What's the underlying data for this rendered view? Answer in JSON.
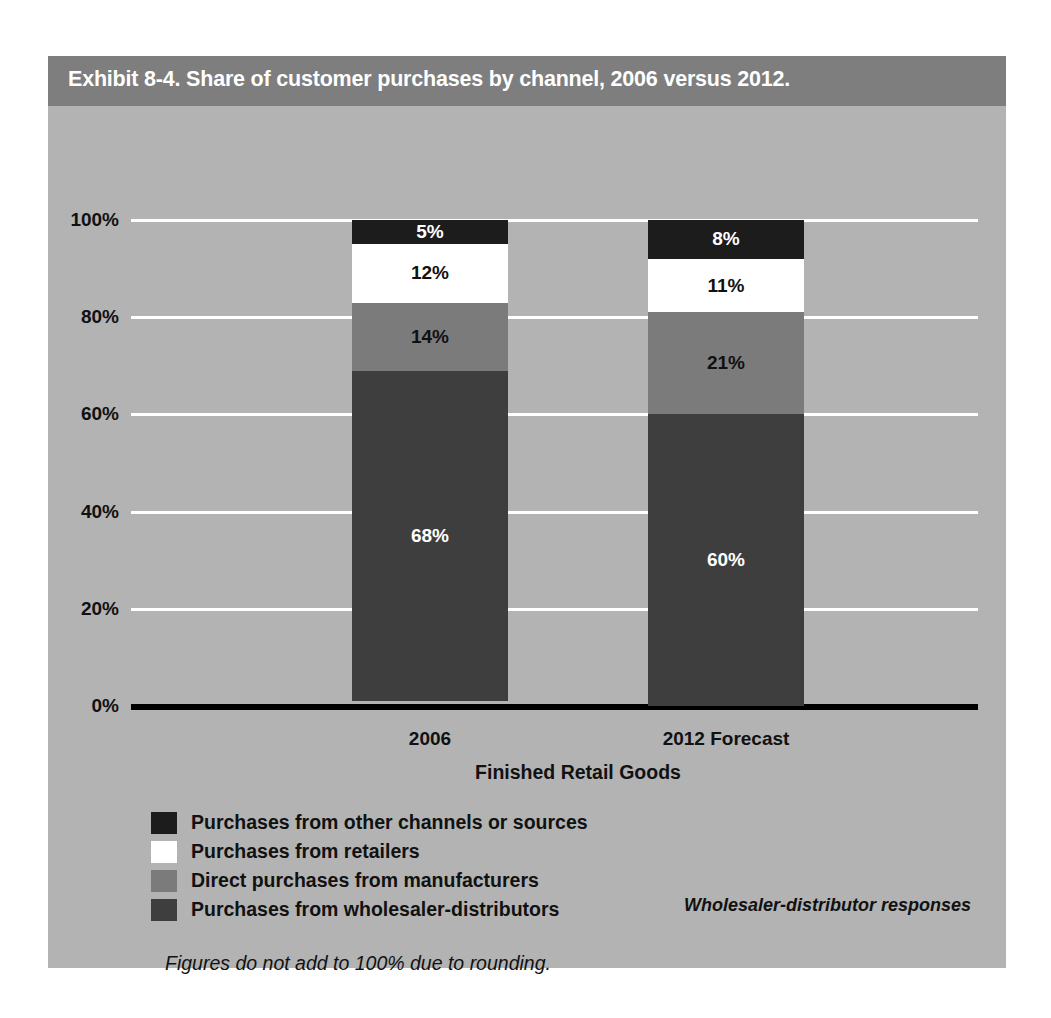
{
  "exhibit": {
    "title": "Exhibit 8-4. Share of customer purchases by channel, 2006 versus 2012.",
    "source_note": "Wholesaler-distributor responses",
    "footnote": "Figures do not add to 100% due to rounding.",
    "colors": {
      "card_background": "#b3b3b3",
      "title_bar": "#7e7e7e",
      "title_text": "#ffffff",
      "gridline": "#ffffff",
      "axis": "#000000",
      "text": "#111111"
    }
  },
  "chart_data": {
    "type": "bar",
    "title": "Exhibit 8-4. Share of customer purchases by channel, 2006 versus 2012.",
    "subtitle": "",
    "stacked": true,
    "categories": [
      "2006",
      "2012 Forecast"
    ],
    "xlabel": "Finished Retail Goods",
    "ylabel": "",
    "ylim": [
      0,
      100
    ],
    "yticks": [
      "0%",
      "20%",
      "40%",
      "60%",
      "80%",
      "100%"
    ],
    "ytick_values": [
      0,
      20,
      40,
      60,
      80,
      100
    ],
    "grid": true,
    "legend_position": "bottom-left",
    "series": [
      {
        "name": "Purchases from other channels or sources",
        "color": "#1c1c1c",
        "label_color": "#ffffff",
        "values": [
          5,
          8
        ],
        "labels": [
          "5%",
          "8%"
        ]
      },
      {
        "name": "Purchases from retailers",
        "color": "#ffffff",
        "label_color": "#111111",
        "values": [
          12,
          11
        ],
        "labels": [
          "12%",
          "11%"
        ]
      },
      {
        "name": "Direct purchases from manufacturers",
        "color": "#7b7b7b",
        "label_color": "#111111",
        "values": [
          14,
          21
        ],
        "labels": [
          "14%",
          "21%"
        ]
      },
      {
        "name": "Purchases from wholesaler-distributors",
        "color": "#3e3e3e",
        "label_color": "#ffffff",
        "values": [
          68,
          60
        ],
        "labels": [
          "68%",
          "60%"
        ]
      }
    ]
  }
}
